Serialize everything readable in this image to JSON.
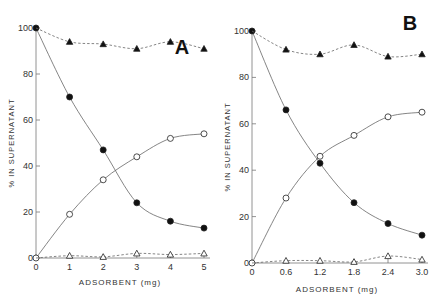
{
  "chart_data": [
    {
      "type": "line",
      "panel_label": "A",
      "xlabel": "ADSORBENT (mg)",
      "ylabel": "% IN SUPERNATANT",
      "x": [
        0,
        1,
        2,
        3,
        4,
        5
      ],
      "x_tick_labels": [
        "0",
        "1",
        "2",
        "3",
        "4",
        "5"
      ],
      "y_tick_labels": [
        "0",
        "20",
        "40",
        "60",
        "80",
        "100"
      ],
      "xlim": [
        0,
        5
      ],
      "ylim": [
        0,
        100
      ],
      "grid": false,
      "series": [
        {
          "name": "filled-circles",
          "marker": "filled-circle",
          "line": "solid",
          "values": [
            100,
            70,
            47,
            24,
            16,
            13
          ]
        },
        {
          "name": "open-circles",
          "marker": "open-circle",
          "line": "solid",
          "values": [
            0,
            19,
            34,
            44,
            52,
            54
          ]
        },
        {
          "name": "filled-triangles",
          "marker": "filled-triangle",
          "line": "dashed",
          "values": [
            100,
            94,
            93,
            91,
            94,
            91
          ]
        },
        {
          "name": "open-triangles",
          "marker": "open-triangle",
          "line": "dashed",
          "values": [
            0,
            1,
            0.5,
            2,
            1.5,
            2
          ]
        }
      ]
    },
    {
      "type": "line",
      "panel_label": "B",
      "xlabel": "ADSORBENT (mg)",
      "ylabel": "% IN SUPERNATANT",
      "x": [
        0,
        0.6,
        1.2,
        1.8,
        2.4,
        3.0
      ],
      "x_tick_labels": [
        "0",
        "0.6",
        "1.2",
        "1.8",
        "2.4",
        "3.0"
      ],
      "y_tick_labels": [
        "0",
        "20",
        "40",
        "60",
        "80",
        "100"
      ],
      "xlim": [
        0,
        3.0
      ],
      "ylim": [
        0,
        100
      ],
      "grid": false,
      "series": [
        {
          "name": "filled-circles",
          "marker": "filled-circle",
          "line": "solid",
          "values": [
            100,
            66,
            43,
            26,
            17,
            12
          ]
        },
        {
          "name": "open-circles",
          "marker": "open-circle",
          "line": "solid",
          "values": [
            0,
            28,
            46,
            55,
            63,
            65
          ]
        },
        {
          "name": "filled-triangles",
          "marker": "filled-triangle",
          "line": "dashed",
          "values": [
            100,
            92,
            90,
            94,
            89,
            90
          ]
        },
        {
          "name": "open-triangles",
          "marker": "open-triangle",
          "line": "dashed",
          "values": [
            0,
            1,
            1,
            0.5,
            3,
            1.5
          ]
        }
      ]
    }
  ]
}
